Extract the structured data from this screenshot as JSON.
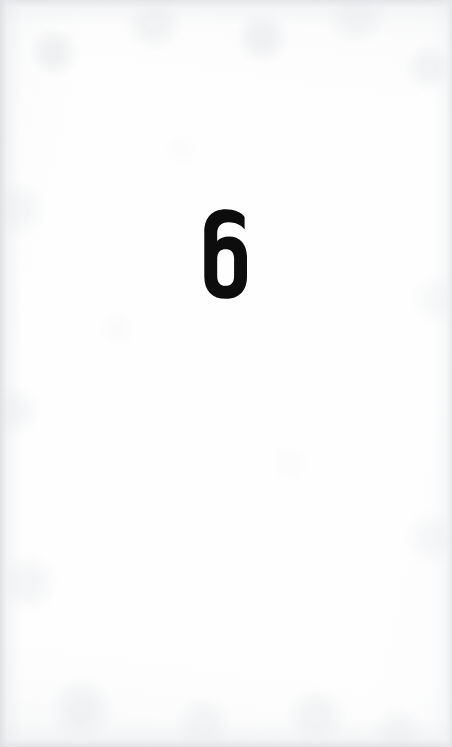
{
  "document": {
    "kind": "scanned-book-page",
    "page_background_color": "#ffffff",
    "edge_shadow_color": "#e3e5e8",
    "ink_color": "#0d0d0e"
  },
  "page": {
    "chapter_number": "6",
    "chapter_number_position": {
      "center_x": 215,
      "top": 210,
      "bottom": 297,
      "width": 38,
      "height": 87
    }
  }
}
